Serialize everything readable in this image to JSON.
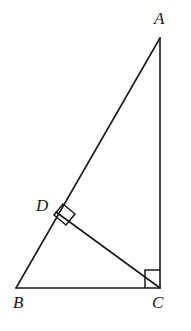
{
  "figure": {
    "kind": "geometry-diagram",
    "background_color": "#ffffff",
    "stroke_color": "#1a1a1a",
    "canvas": {
      "width": 191,
      "height": 331
    },
    "vertices": [
      {
        "id": "A",
        "label": "A",
        "x": 160,
        "y": 38,
        "label_x": 154,
        "label_y": 10
      },
      {
        "id": "B",
        "label": "B",
        "x": 16,
        "y": 288,
        "label_x": 13,
        "label_y": 294
      },
      {
        "id": "C",
        "label": "C",
        "x": 160,
        "y": 288,
        "label_x": 152,
        "label_y": 294
      },
      {
        "id": "D",
        "label": "D",
        "x": 56,
        "y": 212,
        "label_x": 36,
        "label_y": 197
      }
    ],
    "segments": [
      {
        "name": "side-AB-hypotenuse",
        "from": "A",
        "to": "B",
        "path": "M 160 38 L 16 288"
      },
      {
        "name": "side-BC-base",
        "from": "B",
        "to": "C",
        "path": "M 16 288 L 160 288"
      },
      {
        "name": "side-CA-vertical",
        "from": "C",
        "to": "A",
        "path": "M 160 288 L 160 38"
      },
      {
        "name": "altitude-DC",
        "from": "D",
        "to": "C",
        "path": "M 56 212 L 160 288"
      }
    ],
    "right_angle_marks": [
      {
        "name": "right-angle-at-C",
        "at_vertex": "C",
        "degrees": 90,
        "path": "M 160 270 L 145 270 L 145 288"
      },
      {
        "name": "right-angle-at-D",
        "at_vertex": "D",
        "degrees": 90,
        "path": "M 63 204 L 75 214 L 66 225 L 54 215 Z"
      }
    ]
  }
}
